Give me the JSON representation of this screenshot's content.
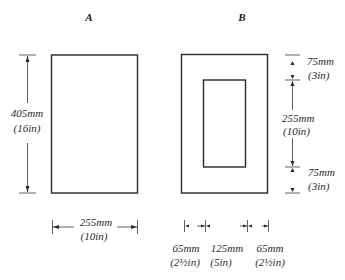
{
  "panels": {
    "a": {
      "title": "A",
      "height_dim": {
        "mm": "405mm",
        "in": "(16in)"
      },
      "width_dim": {
        "mm": "255mm",
        "in": "(10in)"
      }
    },
    "b": {
      "title": "B",
      "top_margin_dim": {
        "mm": "75mm",
        "in": "(3in)"
      },
      "inner_height_dim": {
        "mm": "255mm",
        "in": "(10in)"
      },
      "bottom_margin_dim": {
        "mm": "75mm",
        "in": "(3in)"
      },
      "left_margin_dim": {
        "mm": "65mm",
        "in": "(2½in)"
      },
      "inner_width_dim": {
        "mm": "125mm",
        "in": "(5in)"
      },
      "right_margin_dim": {
        "mm": "65mm",
        "in": "(2½in)"
      }
    }
  },
  "colors": {
    "line": "#2a2a2a",
    "background": "#ffffff"
  }
}
